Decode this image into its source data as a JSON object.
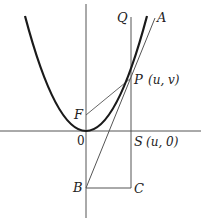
{
  "figure": {
    "type": "parabola-tangent-construction",
    "labels": {
      "Q": "Q",
      "A": "A",
      "P": "P",
      "P_coord": "(u, v)",
      "F": "F",
      "origin": "0",
      "S": "S",
      "S_coord": "(u, 0)",
      "B": "B",
      "C": "C"
    },
    "colors": {
      "curve": "#1a1a1a",
      "lines": "#444444",
      "axes": "#555555",
      "background": "#ffffff"
    }
  }
}
